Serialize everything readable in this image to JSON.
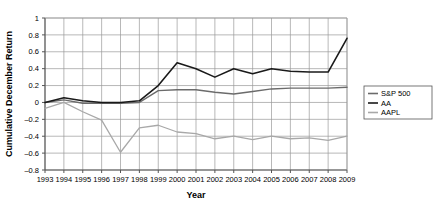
{
  "chart_data": {
    "type": "line",
    "title": "",
    "xlabel": "Year",
    "ylabel": "Cumulative December Return",
    "x": [
      1993,
      1994,
      1995,
      1996,
      1997,
      1998,
      1999,
      2000,
      2001,
      2002,
      2003,
      2004,
      2005,
      2006,
      2007,
      2008,
      2009
    ],
    "categories": [
      "1993",
      "1994",
      "1995",
      "1996",
      "1997",
      "1998",
      "1999",
      "2000",
      "2001",
      "2002",
      "2003",
      "2004",
      "2005",
      "2006",
      "2007",
      "2008",
      "2009"
    ],
    "xlim": [
      1993,
      2009
    ],
    "ylim": [
      -0.8,
      1
    ],
    "yticks": [
      1,
      0.8,
      0.6,
      0.4,
      0.2,
      0,
      -0.2,
      -0.4,
      -0.6,
      -0.8
    ],
    "ytick_labels": [
      "1",
      "0.8",
      "0.6",
      "0.4",
      "0.2",
      "0",
      "–0.2",
      "–0.4",
      "–0.6",
      "–0.8"
    ],
    "grid": true,
    "legend_position": "right",
    "series": [
      {
        "name": "S&P 500",
        "color": "#6b6b6b",
        "width": 1.4,
        "values": [
          0.0,
          0.03,
          -0.01,
          -0.01,
          -0.01,
          0.0,
          0.14,
          0.15,
          0.15,
          0.12,
          0.1,
          0.13,
          0.16,
          0.17,
          0.17,
          0.17,
          0.18
        ]
      },
      {
        "name": "AA",
        "color": "#1a1a1a",
        "width": 1.6,
        "values": [
          0.0,
          0.055,
          0.02,
          0.0,
          0.0,
          0.02,
          0.2,
          0.47,
          0.4,
          0.3,
          0.4,
          0.34,
          0.4,
          0.37,
          0.36,
          0.36,
          0.76
        ]
      },
      {
        "name": "AAPL",
        "color": "#a8a8a8",
        "width": 1.3,
        "values": [
          -0.07,
          0.0,
          -0.11,
          -0.21,
          -0.59,
          -0.3,
          -0.27,
          -0.35,
          -0.37,
          -0.43,
          -0.4,
          -0.44,
          -0.4,
          -0.43,
          -0.42,
          -0.45,
          -0.4
        ]
      }
    ],
    "legend": [
      {
        "label": "S&P 500",
        "color": "#6b6b6b"
      },
      {
        "label": "AA",
        "color": "#1a1a1a"
      },
      {
        "label": "AAPL",
        "color": "#a8a8a8"
      }
    ],
    "colors": {
      "plot_background": "#ffffff",
      "grid": "#999999",
      "axis": "#555555",
      "text": "#000000"
    }
  }
}
